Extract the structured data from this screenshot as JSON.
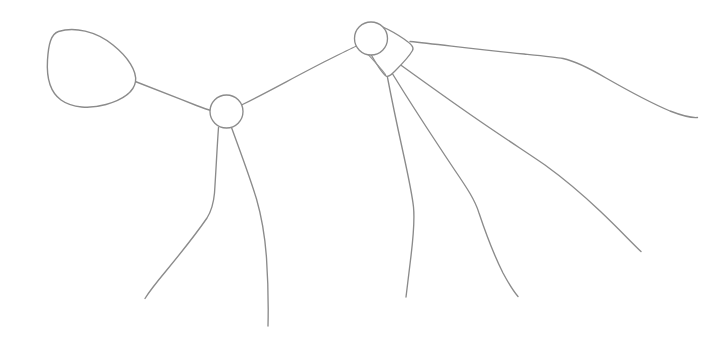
{
  "canvas": {
    "width": 722,
    "height": 342,
    "background_color": "#ffffff",
    "stroke_color": "#8b8b8b",
    "stroke_width": 1.35,
    "style": "hand-drawn-line-sketch",
    "title": "Hand-drawn line sketch",
    "description": "A monochrome hand-drawn outline sketch: a large egg-shaped blob at left joined by a stem to a small circular node, which links up-right to a second circular node capped by a triangular wedge; several long curved strands trail down and to the right."
  },
  "shapes": {
    "blob": {
      "name": "egg-blob",
      "label": "large egg-shaped outline",
      "center_x": 91,
      "center_y": 68,
      "path": "M 58.5 31.5 C 74 26.5, 96 31, 113 45 C 128 57, 137 71, 135.5 81.5 C 134 92, 122 100, 106 104.5 C 90 109, 72 108, 61 100 C 50 92, 46.5 76, 47.5 60 C 48.5 44, 51 34, 58.5 31.5 Z"
    },
    "node_lower": {
      "name": "node-circle-lower",
      "label": "lower circular node",
      "center_x": 226.5,
      "center_y": 111.5,
      "radius": 16.5
    },
    "node_upper": {
      "name": "node-circle-upper",
      "label": "upper circular node",
      "center_x": 371,
      "center_y": 38.5,
      "radius": 16.5
    },
    "wedge": {
      "name": "triangular-wedge",
      "label": "triangular wedge beside upper node",
      "path": "M 366.5 23.5 C 377 22.5, 392 31, 404 39 C 411 44, 414.5 47, 412.5 50.5 C 410 55, 402 64, 395 71 C 390.5 75.5, 388 77.5, 386 76 C 382 73, 374 60, 368.5 50 C 364 41.5, 361.5 33, 363 28 Z",
      "inner_crease_path": "M 363.5 49.5 C 370 56.5, 379 66, 385.5 74.5"
    }
  },
  "connectors": [
    {
      "name": "connector-blob-to-lower-node",
      "label": "stem from egg blob to lower node",
      "path": "M 134 81 C 152 88, 175 97, 196.5 105.5 C 203 108, 207 109.5, 211 110.5"
    },
    {
      "name": "connector-lower-node-to-upper-node",
      "label": "stem from lower node to upper node",
      "path": "M 242.5 104.5 C 268 92, 300 74, 328 60 C 341 53.5, 350 49, 356.5 46"
    }
  ],
  "strands": [
    {
      "name": "strand-lower-left",
      "label": "lower-left trailing strand",
      "origin": "node-circle-lower",
      "end_x": 145,
      "end_y": 298,
      "path": "M 218.5 127.5 C 217 148, 216 171, 214.5 193 C 213.5 204, 212 210, 207 218 C 196 234, 180 254, 166 271 C 156 283, 149 292, 145 298.5"
    },
    {
      "name": "strand-lower-center",
      "label": "lower-center trailing strand",
      "origin": "node-circle-lower",
      "end_x": 268,
      "end_y": 326,
      "path": "M 231.5 127.5 C 240 151, 249.5 176, 256.5 199 C 262 218, 265 237, 266.5 258 C 268 281, 268.5 306, 268 326"
    },
    {
      "name": "strand-wedge-left",
      "label": "left strand from wedge",
      "origin": "triangular-wedge",
      "end_x": 406,
      "end_y": 297,
      "path": "M 387.5 77.5 C 392 101, 397.5 127, 403 152 C 408 175, 412 193, 413.5 207 C 415 222, 413 240, 410.5 260 C 408.5 276, 407 289, 406 297"
    },
    {
      "name": "strand-wedge-center",
      "label": "center strand from wedge",
      "origin": "triangular-wedge",
      "end_x": 518,
      "end_y": 296,
      "path": "M 392 73 C 411 104, 434 139, 454 169 C 467 188, 475 200, 479 213 C 485 231, 494 255, 503 273 C 510 286, 515 293, 518 296.5"
    },
    {
      "name": "strand-wedge-right",
      "label": "right strand from wedge",
      "origin": "triangular-wedge",
      "end_x": 641,
      "end_y": 251,
      "path": "M 400 64.5 C 427 84, 459 107, 487 126 C 512 143, 529 154, 545 165 C 563 178, 582 194, 600 211 C 618 228, 632 243, 641 251.5"
    },
    {
      "name": "strand-top-long",
      "label": "long top strand curving to right edge",
      "origin": "triangular-wedge",
      "end_x": 697,
      "end_y": 117,
      "path": "M 410 41.5 C 443 45, 487 50.5, 524 54 C 545 56, 556 57, 563 58.5 C 575 61, 589 68, 606 78 C 627 90, 651 103, 670 111 C 683 116, 692 118, 697.5 117.5"
    }
  ]
}
